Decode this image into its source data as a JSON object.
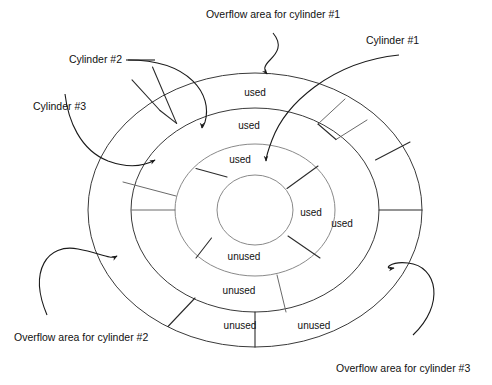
{
  "figure": {
    "type": "concentric-ring-disk-diagram",
    "center": {
      "x": 255,
      "y": 210
    },
    "hole_radius": {
      "rx": 38,
      "ry": 35
    },
    "rings": [
      {
        "id": "cylinder-3",
        "name": "Cylinder #3",
        "rx_inner": 38,
        "ry_inner": 35,
        "rx_outer": 80,
        "ry_outer": 66
      },
      {
        "id": "cylinder-2",
        "name": "Cylinder #2",
        "rx_inner": 80,
        "ry_inner": 66,
        "rx_outer": 124,
        "ry_outer": 102
      },
      {
        "id": "cylinder-1",
        "name": "Cylinder #1",
        "rx_inner": 124,
        "ry_inner": 102,
        "rx_outer": 167,
        "ry_outer": 137
      }
    ]
  },
  "labels": {
    "cylinder_1": "Cylinder #1",
    "cylinder_2": "Cylinder #2",
    "cylinder_3": "Cylinder #3",
    "overflow_1": "Overflow area for cylinder #1",
    "overflow_2": "Overflow area for cylinder #2",
    "overflow_3": "Overflow area for cylinder #3"
  },
  "segments": {
    "ring_outer": [
      {
        "text": "used",
        "x": 255,
        "y": 96
      },
      {
        "text": "unused",
        "x": 240,
        "y": 329
      },
      {
        "text": "unused",
        "x": 314,
        "y": 329
      },
      {
        "text": "used",
        "x": 342,
        "y": 227
      }
    ],
    "ring_middle": [
      {
        "text": "used",
        "x": 249,
        "y": 129
      },
      {
        "text": "unused",
        "x": 239,
        "y": 294
      }
    ],
    "ring_inner": [
      {
        "text": "used",
        "x": 240,
        "y": 163
      },
      {
        "text": "used",
        "x": 311,
        "y": 216
      },
      {
        "text": "unused",
        "x": 244,
        "y": 260
      }
    ]
  },
  "colors": {
    "stroke": "#3a3a3a",
    "stroke_light": "#8a8a8a",
    "text": "#111111",
    "background": "#ffffff"
  }
}
